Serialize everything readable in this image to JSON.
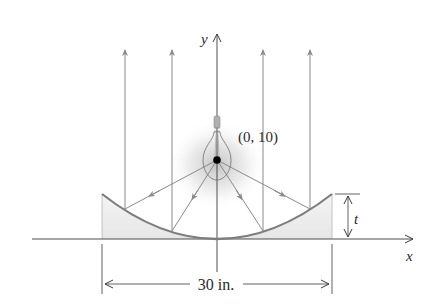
{
  "figure": {
    "labels": {
      "y_axis": "y",
      "x_axis": "x",
      "focus_point": "(0, 10)",
      "depth": "t",
      "width": "30 in."
    },
    "colors": {
      "axis": "#3a3a3a",
      "ray": "#8a8a8a",
      "reflector": "#7d7d7d",
      "reflector_fill": "#ececec",
      "glow": "#bdbdbd",
      "focus_dot": "#000000",
      "text": "#2a2a2a"
    },
    "geometry": {
      "focus": [
        0,
        10
      ],
      "reflector_width_in": 30,
      "parabola": "x^2 = 40y",
      "reflector_depth_symbol": "t"
    }
  }
}
